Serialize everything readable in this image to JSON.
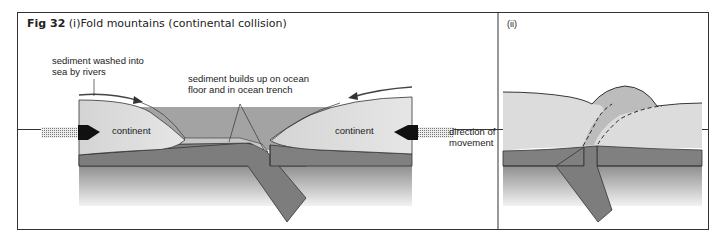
{
  "figure": {
    "number_label": "Fig 32",
    "panel_i_label": "(i)",
    "title": "Fold mountains (continental collision)",
    "panel_ii_label": "(ii)"
  },
  "panel_i": {
    "labels": {
      "sediment_rivers_line1": "sediment washed into",
      "sediment_rivers_line2": "sea by rivers",
      "sediment_ocean_line1": "sediment builds up on ocean",
      "sediment_ocean_line2": "floor and in ocean trench",
      "continent_left": "continent",
      "continent_right": "continent",
      "direction_line1": "direction of",
      "direction_line2": "movement"
    }
  },
  "colors": {
    "border": "#333333",
    "continent_fill": "#d9d9d9",
    "ocean_fill": "#a6a6a6",
    "plate_fill": "#7f7f7f",
    "mantle_top": "#9a9a9a",
    "mantle_bottom": "#ededed",
    "mountain_fill": "#bdbdbd",
    "arrow": "#111111",
    "text": "#222222"
  }
}
